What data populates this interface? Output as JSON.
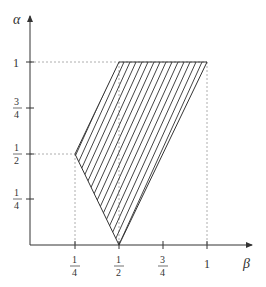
{
  "diagram": {
    "type": "region-plot",
    "axes": {
      "x": {
        "label": "β",
        "ticks": [
          {
            "value": 0.25,
            "num": "1",
            "den": "4"
          },
          {
            "value": 0.5,
            "num": "1",
            "den": "2"
          },
          {
            "value": 0.75,
            "num": "3",
            "den": "4"
          },
          {
            "value": 1,
            "label": "1"
          }
        ]
      },
      "y": {
        "label": "α",
        "ticks": [
          {
            "value": 0.25,
            "num": "1",
            "den": "4"
          },
          {
            "value": 0.5,
            "num": "1",
            "den": "2"
          },
          {
            "value": 0.75,
            "num": "3",
            "den": "4"
          },
          {
            "value": 1,
            "label": "1"
          }
        ]
      }
    },
    "region": {
      "description": "hatched quadrilateral",
      "vertices": [
        [
          0.5,
          0
        ],
        [
          1,
          1
        ],
        [
          0.5,
          1
        ],
        [
          0.25,
          0.5
        ]
      ]
    },
    "guides": "dashed lines at α=1, α=1/2, β=1/4, β=1/2, β=1"
  }
}
